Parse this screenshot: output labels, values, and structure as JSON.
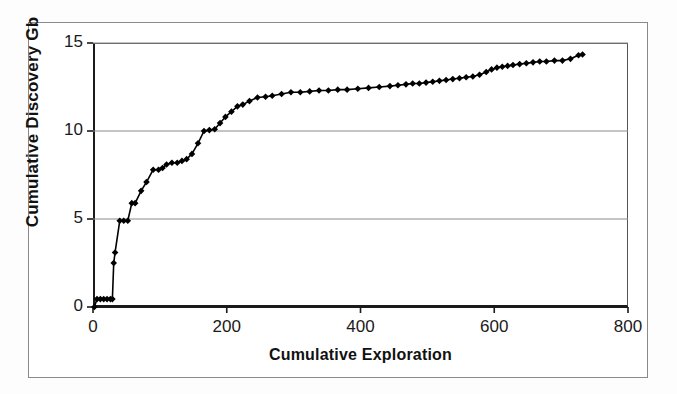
{
  "chart_data": {
    "type": "line",
    "title": "",
    "subtitle": "",
    "xlabel": "Cumulative Exploration",
    "ylabel": "Cumulative Discovery Gb",
    "xlim": [
      0,
      800
    ],
    "ylim": [
      0,
      15
    ],
    "xticks": [
      0,
      200,
      400,
      600,
      800
    ],
    "yticks": [
      0,
      5,
      10,
      15
    ],
    "xtick_labels": [
      "0",
      "200",
      "400",
      "600",
      "800"
    ],
    "ytick_labels": [
      "0",
      "5",
      "10",
      "15"
    ],
    "grid": "horizontal",
    "legend": "none",
    "marker": "diamond",
    "series_color": "#000000",
    "grid_color": "#8a8a8a",
    "axis_color": "#1a1a1a",
    "series": [
      {
        "name": "Cumulative Discovery",
        "x": [
          2,
          6,
          11,
          16,
          21,
          26,
          29,
          31,
          33,
          40,
          46,
          52,
          58,
          63,
          72,
          80,
          90,
          98,
          104,
          110,
          118,
          126,
          133,
          140,
          148,
          157,
          166,
          174,
          182,
          190,
          198,
          207,
          216,
          224,
          234,
          246,
          258,
          268,
          282,
          296,
          310,
          324,
          338,
          352,
          366,
          380,
          396,
          412,
          428,
          444,
          456,
          468,
          478,
          488,
          498,
          508,
          518,
          528,
          538,
          548,
          558,
          568,
          578,
          588,
          596,
          604,
          612,
          620,
          628,
          638,
          648,
          658,
          668,
          678,
          690,
          702,
          714,
          726,
          732
        ],
        "y": [
          0.0,
          0.45,
          0.45,
          0.45,
          0.45,
          0.45,
          0.45,
          2.5,
          3.1,
          4.9,
          4.9,
          4.9,
          5.9,
          5.9,
          6.6,
          7.1,
          7.8,
          7.8,
          7.9,
          8.1,
          8.2,
          8.2,
          8.3,
          8.4,
          8.7,
          9.3,
          10.0,
          10.05,
          10.1,
          10.45,
          10.8,
          11.1,
          11.4,
          11.5,
          11.7,
          11.9,
          11.95,
          12.0,
          12.1,
          12.2,
          12.2,
          12.25,
          12.3,
          12.3,
          12.35,
          12.35,
          12.4,
          12.45,
          12.5,
          12.55,
          12.6,
          12.65,
          12.7,
          12.7,
          12.75,
          12.8,
          12.85,
          12.9,
          12.95,
          13.0,
          13.05,
          13.1,
          13.2,
          13.35,
          13.5,
          13.6,
          13.65,
          13.7,
          13.75,
          13.8,
          13.85,
          13.9,
          13.95,
          13.95,
          14.0,
          14.0,
          14.1,
          14.3,
          14.35
        ]
      }
    ]
  },
  "figure": {
    "background": "#ffffff",
    "border_color": "#8a8a8a"
  }
}
